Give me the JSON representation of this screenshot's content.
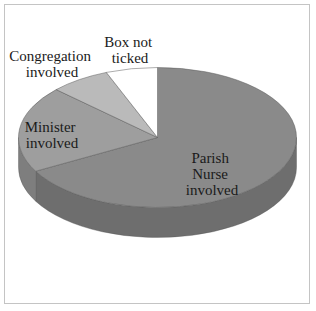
{
  "chart_data": {
    "type": "pie",
    "style": "3d",
    "title": "",
    "categories": [
      "Parish Nurse involved",
      "Minister involved",
      "Congregation involved",
      "Box not ticked"
    ],
    "values": [
      67,
      20,
      7,
      6
    ],
    "unit": "percent (estimated from slice angles)",
    "colors": [
      "#8a8a8a",
      "#9e9e9e",
      "#bababa",
      "#ffffff"
    ],
    "legend": "none (labels placed on/near slices)",
    "labels": [
      {
        "lines": [
          "Parish",
          "Nurse",
          "involved"
        ]
      },
      {
        "lines": [
          "Minister",
          "involved"
        ]
      },
      {
        "lines": [
          "Congregation",
          "involved"
        ]
      },
      {
        "lines": [
          "Box not",
          "ticked"
        ]
      }
    ]
  }
}
